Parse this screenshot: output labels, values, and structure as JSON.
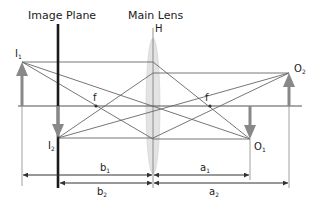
{
  "title_labels": {
    "image_plane": "Image Plane",
    "main_lens": "Main Lens",
    "principal_plane": "H"
  },
  "points": {
    "I1": {
      "label": "I",
      "sub": "1"
    },
    "I2": {
      "label": "I",
      "sub": "2"
    },
    "O1": {
      "label": "O",
      "sub": "1"
    },
    "O2": {
      "label": "O",
      "sub": "2"
    }
  },
  "focal_labels": {
    "left": "f",
    "right": "f"
  },
  "dimensions": {
    "b1": {
      "label": "b",
      "sub": "1"
    },
    "b2": {
      "label": "b",
      "sub": "2"
    },
    "a1": {
      "label": "a",
      "sub": "1"
    },
    "a2": {
      "label": "a",
      "sub": "2"
    }
  },
  "colors": {
    "ray": "#666666",
    "arrow_object": "#888888",
    "image_plane": "#1a1a1a",
    "lens_fill": "#e3e3e3",
    "axis": "#555555",
    "dimension": "#333333"
  }
}
